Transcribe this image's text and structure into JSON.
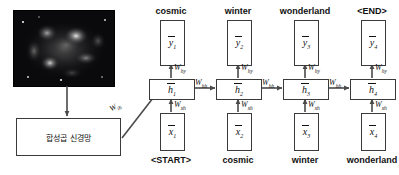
{
  "diagram": {
    "cnn_block": {
      "label": "합성곱 신경망",
      "name": "convolutional-neural-network-box"
    },
    "image_thumbnail": {
      "alt": "nebula-grayscale-photo"
    },
    "input_weight": {
      "base": "W",
      "sub": "ih"
    },
    "weights": {
      "hy": {
        "base": "W",
        "sub": "hy"
      },
      "hh": {
        "base": "W",
        "sub": "hh"
      },
      "xh": {
        "base": "W",
        "sub": "xh"
      }
    },
    "timesteps": [
      {
        "index": 1,
        "output_word": "cosmic",
        "input_word": "<START>",
        "y": {
          "base": "y",
          "sub": "1"
        },
        "h": {
          "base": "h",
          "sub": "1"
        },
        "x": {
          "base": "x",
          "sub": "1"
        }
      },
      {
        "index": 2,
        "output_word": "winter",
        "input_word": "cosmic",
        "y": {
          "base": "y",
          "sub": "2"
        },
        "h": {
          "base": "h",
          "sub": "2"
        },
        "x": {
          "base": "x",
          "sub": "2"
        }
      },
      {
        "index": 3,
        "output_word": "wonderland",
        "input_word": "winter",
        "y": {
          "base": "y",
          "sub": "3"
        },
        "h": {
          "base": "h",
          "sub": "3"
        },
        "x": {
          "base": "x",
          "sub": "3"
        }
      },
      {
        "index": 4,
        "output_word": "<END>",
        "input_word": "wonderland",
        "y": {
          "base": "y",
          "sub": "4"
        },
        "h": {
          "base": "h",
          "sub": "4"
        },
        "x": {
          "base": "x",
          "sub": "4"
        }
      }
    ],
    "colors": {
      "stroke": "#3a3a3a",
      "arrow": "#4a4a4a",
      "text": "#111111",
      "background": "#ffffff"
    }
  }
}
